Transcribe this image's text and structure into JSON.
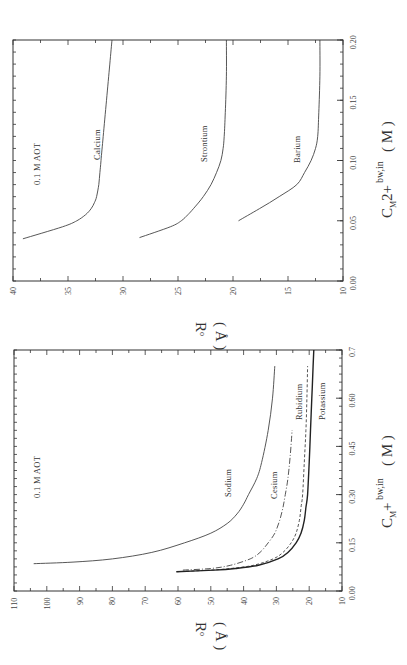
{
  "chart_data": [
    {
      "type": "line",
      "title": "",
      "annotation": "0.1 M AOT",
      "xlabel": "C_M2+ bw,in ( M )",
      "xlabel_parts": {
        "main": "C",
        "sub": "M",
        "mid": "2+",
        "sup": "bw,in",
        "unit": "( M )"
      },
      "ylabel": "R_o ( Å )",
      "ylabel_parts": {
        "main": "R",
        "sub": "o",
        "unit": "( Å )"
      },
      "xlim": [
        0.0,
        0.2
      ],
      "ylim": [
        10,
        40
      ],
      "x_ticks": [
        "0.00",
        "0.05",
        "0.10",
        "0.15",
        "0.20"
      ],
      "y_ticks": [
        "10",
        "15",
        "20",
        "25",
        "30",
        "35",
        "40"
      ],
      "grid": false,
      "orientation": "rotated 90° counter-clockwise",
      "series": [
        {
          "name": "Calcium",
          "style": "solid",
          "x": [
            0.035,
            0.045,
            0.05,
            0.055,
            0.06,
            0.065,
            0.07,
            0.08,
            0.09,
            0.1,
            0.12,
            0.15,
            0.18,
            0.2
          ],
          "y": [
            39.1,
            35.5,
            34.2,
            33.4,
            32.9,
            32.6,
            32.4,
            32.2,
            32.1,
            32.0,
            31.8,
            31.5,
            31.2,
            31.0
          ]
        },
        {
          "name": "Strontium",
          "style": "solid",
          "x": [
            0.036,
            0.045,
            0.05,
            0.055,
            0.06,
            0.07,
            0.08,
            0.09,
            0.1,
            0.11,
            0.12,
            0.14,
            0.17,
            0.2
          ],
          "y": [
            28.5,
            25.7,
            24.7,
            24.1,
            23.6,
            22.7,
            22.0,
            21.5,
            21.1,
            20.9,
            20.8,
            20.7,
            20.6,
            20.6
          ]
        },
        {
          "name": "Barium",
          "style": "solid",
          "x": [
            0.05,
            0.06,
            0.07,
            0.08,
            0.09,
            0.1,
            0.11,
            0.12,
            0.14,
            0.17,
            0.2
          ],
          "y": [
            19.5,
            17.6,
            15.8,
            14.2,
            13.5,
            12.9,
            12.5,
            12.3,
            12.2,
            12.1,
            12.1
          ]
        }
      ]
    },
    {
      "type": "line",
      "title": "",
      "annotation": "0.1 M AOT",
      "xlabel": "C_M+ bw,in ( M )",
      "xlabel_parts": {
        "main": "C",
        "sub": "M",
        "mid": "+",
        "sup": "bw,in",
        "unit": "( M )"
      },
      "ylabel": "R_o ( Å )",
      "ylabel_parts": {
        "main": "R",
        "sub": "o",
        "unit": "( Å )"
      },
      "xlim": [
        0.0,
        0.75
      ],
      "ylim": [
        10,
        110
      ],
      "x_ticks": [
        "0.00",
        "0.15",
        "0.30",
        "0.45",
        "0.60",
        "0.7"
      ],
      "y_ticks": [
        "10",
        "20",
        "30",
        "40",
        "50",
        "60",
        "70",
        "80",
        "90",
        "100",
        "110"
      ],
      "grid": false,
      "orientation": "rotated 90° counter-clockwise",
      "series": [
        {
          "name": "Sodium",
          "style": "solid",
          "x": [
            0.085,
            0.09,
            0.1,
            0.12,
            0.15,
            0.18,
            0.21,
            0.24,
            0.27,
            0.3,
            0.35,
            0.4,
            0.5,
            0.6,
            0.7
          ],
          "y": [
            104,
            92,
            80,
            68,
            58,
            50,
            45,
            42,
            40,
            38.5,
            36,
            34.5,
            32.5,
            31.2,
            30.5
          ]
        },
        {
          "name": "Cesium",
          "style": "dash-dot",
          "x": [
            0.065,
            0.07,
            0.08,
            0.1,
            0.12,
            0.15,
            0.18,
            0.22,
            0.26,
            0.3,
            0.35,
            0.42,
            0.5
          ],
          "y": [
            58.5,
            50,
            44,
            38,
            35,
            32.5,
            30.5,
            29,
            28,
            27.3,
            26.5,
            25.8,
            25.2
          ]
        },
        {
          "name": "Rubidium",
          "style": "dashed",
          "x": [
            0.06,
            0.065,
            0.07,
            0.08,
            0.1,
            0.12,
            0.15,
            0.18,
            0.22,
            0.26,
            0.3,
            0.4,
            0.5,
            0.6,
            0.7
          ],
          "y": [
            60.5,
            50,
            44,
            37,
            31,
            28,
            25.5,
            24,
            23,
            22.5,
            22.0,
            21.5,
            21.0,
            20.7,
            20.5
          ]
        },
        {
          "name": "Potassium",
          "style": "solid-bold",
          "x": [
            0.06,
            0.065,
            0.07,
            0.08,
            0.1,
            0.12,
            0.15,
            0.18,
            0.22,
            0.26,
            0.3,
            0.4,
            0.5,
            0.6,
            0.7,
            0.75
          ],
          "y": [
            60.5,
            49,
            42.5,
            35.5,
            29.5,
            26.5,
            24.0,
            22.5,
            21.5,
            21.0,
            20.5,
            20.0,
            19.6,
            19.2,
            18.8,
            18.6
          ]
        }
      ]
    }
  ],
  "labels": {
    "top": {
      "annotation": "0.1 M AOT",
      "calcium": "Calcium",
      "strontium": "Strontium",
      "barium": "Barium",
      "x_main": "C",
      "x_sub": "M",
      "x_mid": "2+",
      "x_sup": "bw,in",
      "x_unit": "( M )",
      "y_main": "R",
      "y_sub": "o",
      "y_unit": "( Å )"
    },
    "bottom": {
      "annotation": "0.1 M AOT",
      "sodium": "Sodium",
      "cesium": "Cesium",
      "rubidium": "Rubidium",
      "potassium": "Potassium",
      "x_main": "C",
      "x_sub": "M",
      "x_mid": "+",
      "x_sup": "bw,in",
      "x_unit": "( M )",
      "y_main": "R",
      "y_sub": "o",
      "y_unit": "( Å )"
    }
  }
}
